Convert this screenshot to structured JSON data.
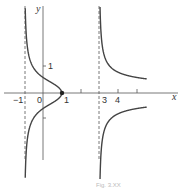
{
  "figure": {
    "x_axis_label": "x",
    "y_axis_label": "y",
    "x_tick_labels": [
      "−1",
      "0",
      "1",
      "3",
      "4"
    ],
    "y_tick_labels": [
      "1"
    ],
    "caption": "Fig. 3.XX",
    "asymptote_color": "#555555",
    "curve_color": "#444444"
  },
  "chart_data": {
    "type": "line",
    "title": "",
    "xlabel": "x",
    "ylabel": "y",
    "equation": "y^2 = (x-1)/((x+1)(x-3))",
    "vertical_asymptotes": [
      -1,
      3
    ],
    "horizontal_asymptote": 0,
    "marked_point": [
      1,
      0
    ],
    "x_ticks": [
      -1,
      0,
      1,
      2,
      3,
      4,
      5
    ],
    "y_ticks": [
      -1,
      1
    ],
    "xlim": [
      -2.2,
      5.5
    ],
    "ylim": [
      -3.3,
      3.3
    ],
    "grid": false,
    "series": [
      {
        "name": "upper branch left",
        "x": [
          -0.95,
          -0.8,
          -0.5,
          0,
          0.5,
          1
        ],
        "y": [
          3.1,
          1.5,
          0.93,
          0.58,
          0.38,
          0
        ]
      },
      {
        "name": "lower branch left",
        "x": [
          -0.95,
          -0.8,
          -0.5,
          0,
          0.5,
          1
        ],
        "y": [
          -3.1,
          -1.5,
          -0.93,
          -0.58,
          -0.38,
          0
        ]
      },
      {
        "name": "upper branch right",
        "x": [
          3.05,
          3.2,
          3.5,
          4,
          5,
          5.5
        ],
        "y": [
          3.2,
          1.5,
          1.08,
          0.77,
          0.58,
          0.53
        ]
      },
      {
        "name": "lower branch right",
        "x": [
          3.05,
          3.2,
          3.5,
          4,
          5,
          5.5
        ],
        "y": [
          -3.2,
          -1.5,
          -1.08,
          -0.77,
          -0.58,
          -0.53
        ]
      }
    ]
  }
}
